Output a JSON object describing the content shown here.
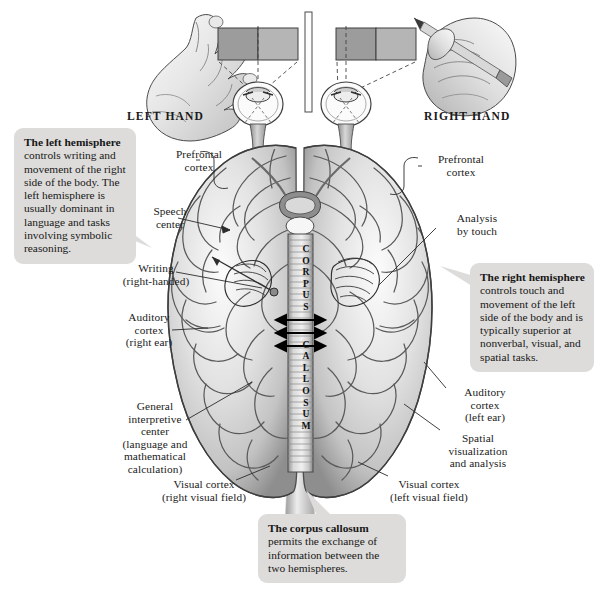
{
  "figure": {
    "background_color": "#ffffff",
    "callout_fill": "#dddcda",
    "ink_color": "#1b1b1b"
  },
  "top_panel": {
    "left_hand_label": "LEFT HAND",
    "right_hand_label": "RIGHT HAND",
    "divider": "central fixation screen",
    "stimulus_card": {
      "left_half_color": "#9c9c9c",
      "right_half_color": "#b5b5b5"
    }
  },
  "center_structure": {
    "name": "corpus callosum",
    "vertical_letters": [
      "C",
      "O",
      "R",
      "P",
      "U",
      "S",
      "C",
      "A",
      "L",
      "L",
      "O",
      "S",
      "U",
      "M"
    ],
    "arrow_count": 3,
    "arrow_direction": "bidirectional"
  },
  "labels_left": [
    {
      "key": "prefrontal-cortex-left",
      "text": "Prefrontal\ncortex",
      "x": 160,
      "y": 148,
      "w": 78
    },
    {
      "key": "speech-center",
      "text": "Speech\ncenter",
      "x": 135,
      "y": 205,
      "w": 70
    },
    {
      "key": "writing",
      "text": "Writing\n(right-handed)",
      "x": 110,
      "y": 262,
      "w": 92
    },
    {
      "key": "auditory-cortex-right",
      "text": "Auditory\ncortex\n(right ear)",
      "x": 110,
      "y": 311,
      "w": 78
    },
    {
      "key": "general-interpretive",
      "text": "General\ninterpretive\ncenter\n(language and\nmathematical\ncalculation)",
      "x": 112,
      "y": 400,
      "w": 86
    },
    {
      "key": "visual-cortex-right",
      "text": "Visual cortex\n(right visual field)",
      "x": 148,
      "y": 478,
      "w": 112
    }
  ],
  "labels_right": [
    {
      "key": "prefrontal-cortex-right",
      "text": "Prefrontal\ncortex",
      "x": 422,
      "y": 153,
      "w": 78
    },
    {
      "key": "analysis-by-touch",
      "text": "Analysis\nby touch",
      "x": 440,
      "y": 212,
      "w": 74
    },
    {
      "key": "auditory-cortex-left",
      "text": "Auditory\ncortex\n(left ear)",
      "x": 448,
      "y": 386,
      "w": 74
    },
    {
      "key": "spatial-visualization",
      "text": "Spatial\nvisualization\nand analysis",
      "x": 432,
      "y": 432,
      "w": 92
    },
    {
      "key": "visual-cortex-left",
      "text": "Visual cortex\n(left visual field)",
      "x": 370,
      "y": 478,
      "w": 118
    }
  ],
  "callouts": {
    "left_hemisphere": {
      "heading": "The left hemisphere",
      "body": " controls writing and movement of the right side of the body. The left hemisphere is usually dominant in language and tasks involving symbolic reasoning.",
      "x": 14,
      "y": 128,
      "w": 122,
      "h": 105
    },
    "right_hemisphere": {
      "heading": "The right hemisphere",
      "body": " controls touch and movement of the left side of the body and is typically superior at nonverbal, visual, and spatial tasks.",
      "x": 470,
      "y": 263,
      "w": 124,
      "h": 92
    },
    "corpus_callosum": {
      "heading": "The corpus callosum",
      "body": " permits the exchange of information between the two hemispheres.",
      "x": 258,
      "y": 514,
      "w": 148,
      "h": 62
    }
  }
}
